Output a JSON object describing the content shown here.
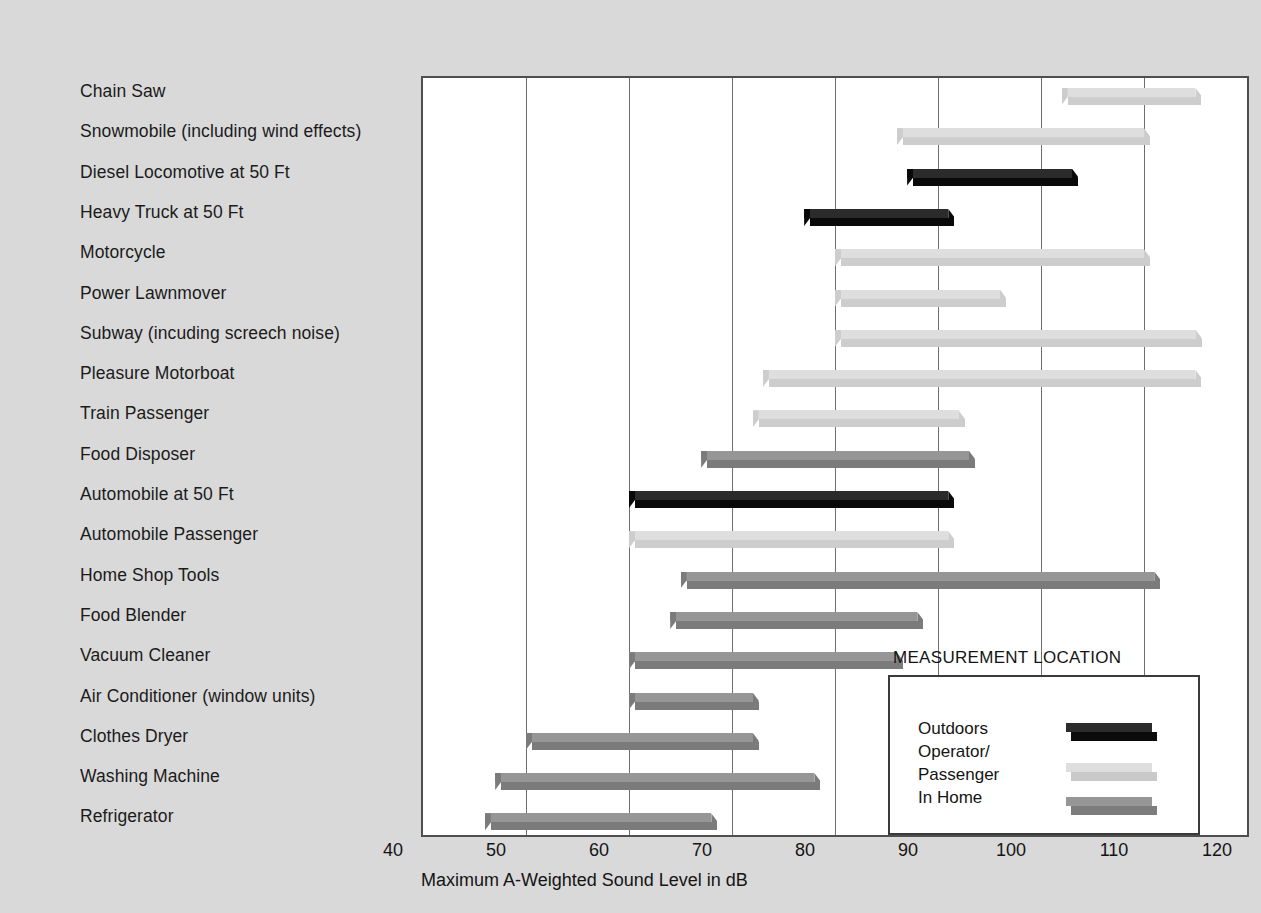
{
  "chart_data": {
    "type": "bar",
    "orientation": "horizontal-range",
    "title": "",
    "xlabel": "Maximum A-Weighted Sound Level in dB",
    "ylabel": "",
    "xlim": [
      40,
      120
    ],
    "xticks": [
      40,
      50,
      60,
      70,
      80,
      90,
      100,
      110,
      120
    ],
    "grid": "vertical",
    "legend": {
      "title": "MEASUREMENT LOCATION",
      "position": "inside-bottom-right",
      "entries": [
        {
          "label": "Outdoors",
          "color": "#2b2b2b",
          "front": "#0b0b0b"
        },
        {
          "label": "Operator/\nPassenger",
          "line1": "Operator/",
          "line2": "Passenger",
          "color": "#dedede",
          "front": "#c9c9c9"
        },
        {
          "label": "In Home",
          "color": "#969696",
          "front": "#7c7c7c"
        }
      ]
    },
    "categories": [
      "Chain Saw",
      "Snowmobile (including wind effects)",
      "Diesel Locomotive at 50 Ft",
      "Heavy Truck at 50 Ft",
      "Motorcycle",
      "Power Lawnmover",
      "Subway (incuding screech noise)",
      "Pleasure Motorboat",
      "Train Passenger",
      "Food Disposer",
      "Automobile at 50 Ft",
      "Automobile Passenger",
      "Home Shop Tools",
      "Food Blender",
      "Vacuum Cleaner",
      "Air Conditioner (window units)",
      "Clothes Dryer",
      "Washing Machine",
      "Refrigerator"
    ],
    "bars": [
      {
        "category": "Chain Saw",
        "start": 102,
        "end": 115,
        "group": "Operator/Passenger"
      },
      {
        "category": "Snowmobile (including wind effects)",
        "start": 86,
        "end": 110,
        "group": "Operator/Passenger"
      },
      {
        "category": "Diesel Locomotive at 50 Ft",
        "start": 87,
        "end": 103,
        "group": "Outdoors"
      },
      {
        "category": "Heavy Truck at 50 Ft",
        "start": 77,
        "end": 91,
        "group": "Outdoors"
      },
      {
        "category": "Motorcycle",
        "start": 80,
        "end": 110,
        "group": "Operator/Passenger"
      },
      {
        "category": "Power Lawnmover",
        "start": 80,
        "end": 96,
        "group": "Operator/Passenger"
      },
      {
        "category": "Subway (incuding screech noise)",
        "start": 80,
        "end": 115,
        "group": "Operator/Passenger"
      },
      {
        "category": "Pleasure Motorboat",
        "start": 73,
        "end": 115,
        "group": "Operator/Passenger"
      },
      {
        "category": "Train Passenger",
        "start": 72,
        "end": 92,
        "group": "Operator/Passenger"
      },
      {
        "category": "Food Disposer",
        "start": 67,
        "end": 93,
        "group": "In Home"
      },
      {
        "category": "Automobile at 50 Ft",
        "start": 60,
        "end": 91,
        "group": "Outdoors"
      },
      {
        "category": "Automobile Passenger",
        "start": 60,
        "end": 91,
        "group": "Operator/Passenger"
      },
      {
        "category": "Home Shop Tools",
        "start": 65,
        "end": 111,
        "group": "In Home"
      },
      {
        "category": "Food Blender",
        "start": 64,
        "end": 88,
        "group": "In Home"
      },
      {
        "category": "Vacuum Cleaner",
        "start": 60,
        "end": 86,
        "group": "In Home"
      },
      {
        "category": "Air Conditioner (window units)",
        "start": 60,
        "end": 72,
        "group": "In Home"
      },
      {
        "category": "Clothes Dryer",
        "start": 50,
        "end": 72,
        "group": "In Home"
      },
      {
        "category": "Washing Machine",
        "start": 47,
        "end": 78,
        "group": "In Home"
      },
      {
        "category": "Refrigerator",
        "start": 46,
        "end": 68,
        "group": "In Home"
      }
    ]
  },
  "axis": {
    "tick_labels": [
      "40",
      "50",
      "60",
      "70",
      "80",
      "90",
      "100",
      "110",
      "120"
    ],
    "x_axis_title": "Maximum A-Weighted Sound Level in dB"
  },
  "legend": {
    "title": "MEASUREMENT LOCATION",
    "outdoors": "Outdoors",
    "operator_line1": "Operator/",
    "operator_line2": "Passenger",
    "in_home": "In Home"
  },
  "colors": {
    "background": "#d9d9d9",
    "plot_background": "#ffffff",
    "plot_border": "#4f4f4f",
    "gridline": "#6e6e6e",
    "outdoors_top": "#2b2b2b",
    "outdoors_front": "#090909",
    "operator_top": "#dedede",
    "operator_front": "#cdcdcd",
    "inhome_top": "#969696",
    "inhome_front": "#7b7b7b",
    "text": "#141414"
  }
}
